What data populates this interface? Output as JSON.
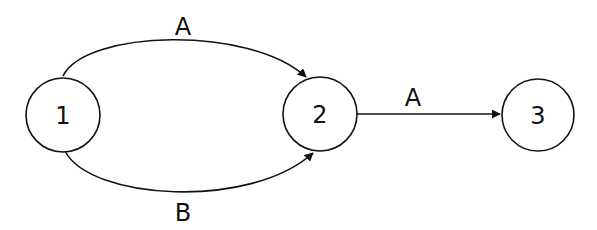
{
  "diagram": {
    "type": "state-transition",
    "nodes": [
      {
        "id": "1",
        "label": "1"
      },
      {
        "id": "2",
        "label": "2"
      },
      {
        "id": "3",
        "label": "3"
      }
    ],
    "edges": [
      {
        "from": "1",
        "to": "2",
        "label": "A",
        "route": "upper-arc"
      },
      {
        "from": "1",
        "to": "2",
        "label": "B",
        "route": "lower-arc"
      },
      {
        "from": "2",
        "to": "3",
        "label": "A",
        "route": "straight"
      }
    ],
    "colors": {
      "stroke": "#111111",
      "background": "#ffffff"
    }
  }
}
